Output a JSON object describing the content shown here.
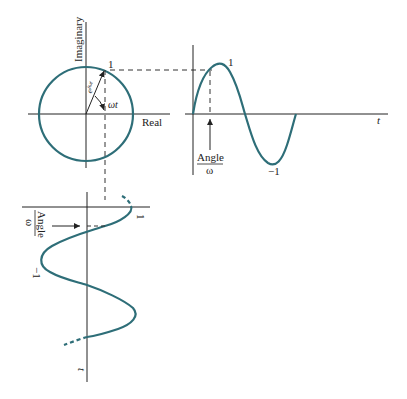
{
  "diagram": {
    "phasor": {
      "axis_vertical_label": "Imaginary",
      "axis_horizontal_label": "Real",
      "point_label": "1",
      "vector_label": "e^{jωt}",
      "vector_label_base": "e",
      "vector_label_exp": "jωt",
      "angle_label": "ωt"
    },
    "time_plot_right": {
      "peak_label": "1",
      "trough_label": "−1",
      "axis_label": "t",
      "angle_label_top": "Angle",
      "angle_label_bottom": "ω"
    },
    "time_plot_bottom": {
      "peak_label": "1",
      "trough_label": "−1",
      "axis_label": "t",
      "angle_label_top": "Angle",
      "angle_label_bottom": "ω"
    },
    "colors": {
      "curve": "#2e6e78",
      "axes": "#222222",
      "dashed": "#333333"
    }
  }
}
